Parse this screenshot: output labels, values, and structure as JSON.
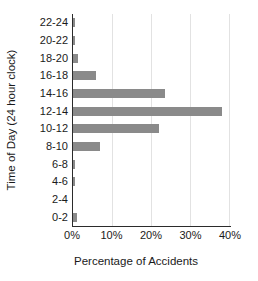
{
  "chart_data": {
    "type": "bar",
    "orientation": "horizontal",
    "title": "",
    "xlabel": "Percentage of Accidents",
    "ylabel": "Time of Day (24 hour clock)",
    "categories": [
      "0-2",
      "2-4",
      "4-6",
      "6-8",
      "8-10",
      "10-12",
      "12-14",
      "14-16",
      "16-18",
      "18-20",
      "20-22",
      "22-24"
    ],
    "values": [
      1.0,
      0.0,
      0.4,
      0.4,
      7.0,
      21.8,
      38.0,
      23.5,
      5.8,
      1.2,
      0.4,
      0.4
    ],
    "xlim": [
      0,
      40
    ],
    "xticks": [
      0,
      10,
      20,
      30,
      40
    ],
    "xtick_labels": [
      "0%",
      "10%",
      "20%",
      "30%",
      "40%"
    ],
    "grid": true,
    "legend": null,
    "bar_color": "#8a8a8a",
    "axis_color": "#2b2b2b",
    "grid_color": "#e2e2e2"
  }
}
